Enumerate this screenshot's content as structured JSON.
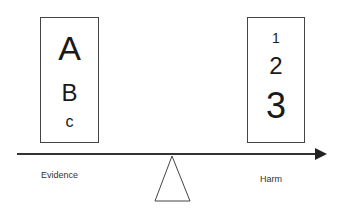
{
  "diagram": {
    "type": "balance-scale",
    "left_box": {
      "letters": [
        "A",
        "B",
        "C"
      ],
      "label": "Evidence"
    },
    "right_box": {
      "numbers": [
        "1",
        "2",
        "3"
      ],
      "label": "Harm"
    },
    "beam": {
      "direction": "arrow-right"
    },
    "fulcrum": {
      "shape": "triangle"
    },
    "colors": {
      "stroke": "#333333",
      "text": "#1a1a1a",
      "background": "#ffffff"
    }
  }
}
